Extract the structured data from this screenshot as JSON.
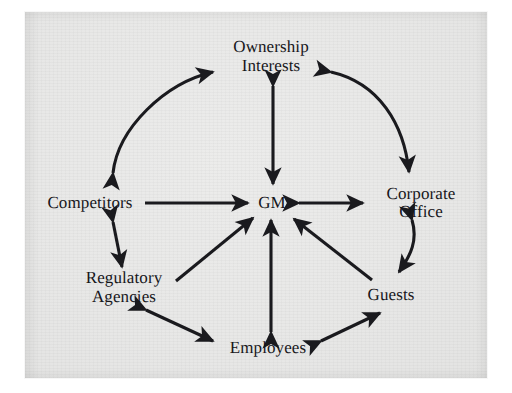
{
  "figure": {
    "background_color": "#ffffff",
    "panel_color": "#e8e8e7",
    "ink_color": "#1a1a1e"
  },
  "nodes": [
    {
      "id": "ownership-interests",
      "label": "Ownership\nInterests",
      "x": 271,
      "y": 56,
      "lines": 2
    },
    {
      "id": "competitors",
      "label": "Competitors",
      "x": 90,
      "y": 203,
      "lines": 1
    },
    {
      "id": "gm",
      "label": "GM",
      "x": 272,
      "y": 203,
      "lines": 1
    },
    {
      "id": "corporate-office",
      "label": "Corporate Office",
      "x": 421,
      "y": 203,
      "lines": 1
    },
    {
      "id": "regulatory-agencies",
      "label": "Regulatory\nAgencies",
      "x": 124,
      "y": 287,
      "lines": 2
    },
    {
      "id": "guests",
      "label": "Guests",
      "x": 391,
      "y": 295,
      "lines": 1
    },
    {
      "id": "employees",
      "label": "Employees",
      "x": 268,
      "y": 348,
      "lines": 1
    }
  ],
  "edges": [
    {
      "id": "competitors-ownership",
      "from": "competitors",
      "to": "ownership-interests",
      "style": "curved",
      "heads": "both"
    },
    {
      "id": "ownership-corporate",
      "from": "ownership-interests",
      "to": "corporate-office",
      "style": "curved",
      "heads": "both"
    },
    {
      "id": "ownership-gm",
      "from": "ownership-interests",
      "to": "gm",
      "style": "straight",
      "heads": "both"
    },
    {
      "id": "competitors-gm",
      "from": "competitors",
      "to": "gm",
      "style": "straight",
      "heads": "end"
    },
    {
      "id": "gm-corporate",
      "from": "gm",
      "to": "corporate-office",
      "style": "straight",
      "heads": "both"
    },
    {
      "id": "competitors-regulatory",
      "from": "competitors",
      "to": "regulatory-agencies",
      "style": "straight",
      "heads": "both"
    },
    {
      "id": "regulatory-gm",
      "from": "regulatory-agencies",
      "to": "gm",
      "style": "straight",
      "heads": "end"
    },
    {
      "id": "employees-gm",
      "from": "employees",
      "to": "gm",
      "style": "straight",
      "heads": "both"
    },
    {
      "id": "guests-gm",
      "from": "guests",
      "to": "gm",
      "style": "straight",
      "heads": "end"
    },
    {
      "id": "corporate-guests",
      "from": "corporate-office",
      "to": "guests",
      "style": "curved",
      "heads": "both"
    },
    {
      "id": "regulatory-employees",
      "from": "regulatory-agencies",
      "to": "employees",
      "style": "straight",
      "heads": "both"
    },
    {
      "id": "employees-guests",
      "from": "employees",
      "to": "guests",
      "style": "straight",
      "heads": "both"
    }
  ]
}
